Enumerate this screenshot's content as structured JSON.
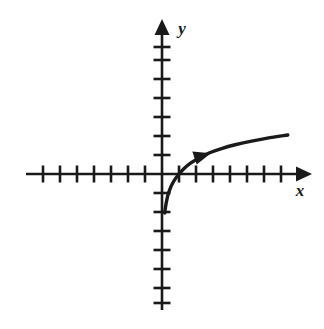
{
  "figure": {
    "background_color": "#ffffff",
    "ink_color": "#1a1a1a"
  },
  "axes": {
    "x_axis": {
      "name": "x-axis",
      "label": "x",
      "has_arrowhead": true,
      "arrow_direction": "right",
      "tick_count_negative": 7,
      "tick_count_positive": 7
    },
    "y_axis": {
      "name": "y-axis",
      "label": "y",
      "has_arrowhead": true,
      "arrow_direction": "up",
      "tick_count_positive": 7,
      "tick_count_negative": 7
    },
    "origin_label": ""
  },
  "curve": {
    "name": "logarithmic-curve",
    "description": "Increasing concave-down curve with vertical asymptote at x = 0, crossing the x-axis at x = 1",
    "direction_arrow": "right",
    "direction_arrow_present": true
  },
  "chart_data": {
    "type": "line",
    "title": "",
    "xlabel": "x",
    "ylabel": "y",
    "xlim": [
      -7.5,
      8.2
    ],
    "ylim": [
      -8.2,
      7.8
    ],
    "grid": false,
    "legend": null,
    "x_ticks": [
      -7,
      -6,
      -5,
      -4,
      -3,
      -2,
      -1,
      1,
      2,
      3,
      4,
      5,
      6,
      7
    ],
    "y_ticks": [
      -7,
      -6,
      -5,
      -4,
      -3,
      -2,
      -1,
      1,
      2,
      3,
      4,
      5,
      6,
      7
    ],
    "x_tick_labels": [],
    "y_tick_labels": [],
    "series": [
      {
        "name": "y = log(x)",
        "x": [
          0.16,
          0.2,
          0.26,
          0.34,
          0.45,
          0.6,
          0.8,
          1.0,
          1.3,
          1.7,
          2.2,
          2.8,
          3.5,
          4.3,
          5.2,
          6.2,
          7.4
        ],
        "y": [
          -2.05,
          -1.78,
          -1.47,
          -1.14,
          -0.83,
          -0.53,
          -0.23,
          0.0,
          0.29,
          0.58,
          0.86,
          1.12,
          1.34,
          1.54,
          1.72,
          1.89,
          2.05
        ]
      }
    ],
    "annotations": [
      {
        "name": "direction-arrowhead",
        "type": "arrowhead",
        "x": 2.4,
        "y": 0.95,
        "points": "right"
      }
    ]
  }
}
